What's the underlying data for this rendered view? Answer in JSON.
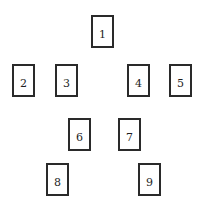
{
  "diagram": {
    "type": "card-spread-layout",
    "border_color": "#2a2a2a",
    "text_color": "#1e1e1e",
    "cards": [
      {
        "label": "1"
      },
      {
        "label": "2"
      },
      {
        "label": "3"
      },
      {
        "label": "4"
      },
      {
        "label": "5"
      },
      {
        "label": "6"
      },
      {
        "label": "7"
      },
      {
        "label": "8"
      },
      {
        "label": "9"
      }
    ]
  }
}
